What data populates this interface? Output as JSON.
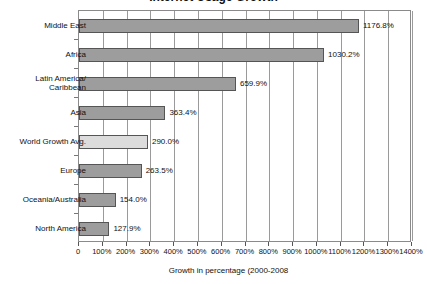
{
  "chart_data": {
    "type": "bar",
    "orientation": "horizontal",
    "title": "Internet Usage Growth",
    "xlabel": "Growth in percentage (2000-2008",
    "ylabel": "",
    "xlim": [
      0,
      1400
    ],
    "grid": true,
    "legend": false,
    "categories": [
      "Middle East",
      "Africa",
      "Latin America/\nCaribbean",
      "Asia",
      "World Growth Avg.",
      "Europe",
      "Oceania/Australia",
      "North America"
    ],
    "values": [
      1176.8,
      1030.2,
      659.9,
      363.4,
      290.0,
      263.5,
      154.0,
      127.9
    ],
    "value_labels": [
      "1176.8%",
      "1030.2%",
      "659.9%",
      "363.4%",
      "290.0%",
      "263.5%",
      "154.0%",
      "127.9%"
    ],
    "highlight_index": 4,
    "xticks": [
      0,
      100,
      200,
      300,
      400,
      500,
      600,
      700,
      800,
      900,
      1000,
      1100,
      1200,
      1300,
      1400
    ],
    "xtick_labels": [
      "0",
      "100%",
      "200%",
      "300%",
      "400%",
      "500%",
      "600%",
      "700%",
      "800%",
      "900%",
      "1000%",
      "1100%",
      "1200%",
      "1300%",
      "1400%"
    ],
    "colors": {
      "bar": "#9d9d9d",
      "bar_border": "#555555",
      "bar_highlight": "#dcdcdc",
      "grid": "#9a9a9a",
      "frame": "#8a8a8a",
      "text": "#111111",
      "background": "#ffffff"
    }
  }
}
